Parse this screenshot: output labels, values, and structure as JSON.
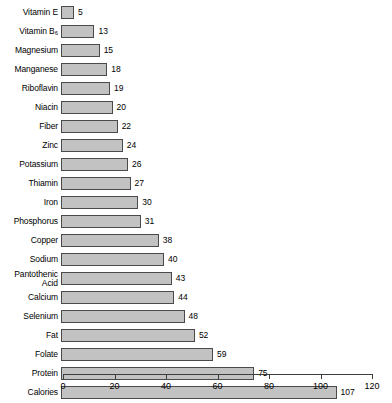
{
  "chart_data": {
    "type": "bar",
    "orientation": "horizontal",
    "title": "",
    "subtitle": "",
    "xlabel": "",
    "ylabel": "",
    "xlim": [
      0,
      120
    ],
    "xticks": [
      0,
      20,
      40,
      60,
      80,
      100,
      120
    ],
    "grid": false,
    "legend": null,
    "bar_color": "#c2c2c2",
    "bar_border_color": "#4a4a4a",
    "background": "#ffffff",
    "value_labels": true,
    "categories": [
      "Vitamin E",
      "Vitamin B₆",
      "Magnesium",
      "Manganese",
      "Riboflavin",
      "Niacin",
      "Fiber",
      "Zinc",
      "Potassium",
      "Thiamin",
      "Iron",
      "Phosphorus",
      "Copper",
      "Sodium",
      "Pantothenic\nAcid",
      "Calcium",
      "Selenium",
      "Fat",
      "Folate",
      "Protein",
      "Calories"
    ],
    "values": [
      5,
      13,
      15,
      18,
      19,
      20,
      22,
      24,
      26,
      27,
      30,
      31,
      38,
      40,
      43,
      44,
      48,
      52,
      59,
      75,
      107
    ]
  }
}
